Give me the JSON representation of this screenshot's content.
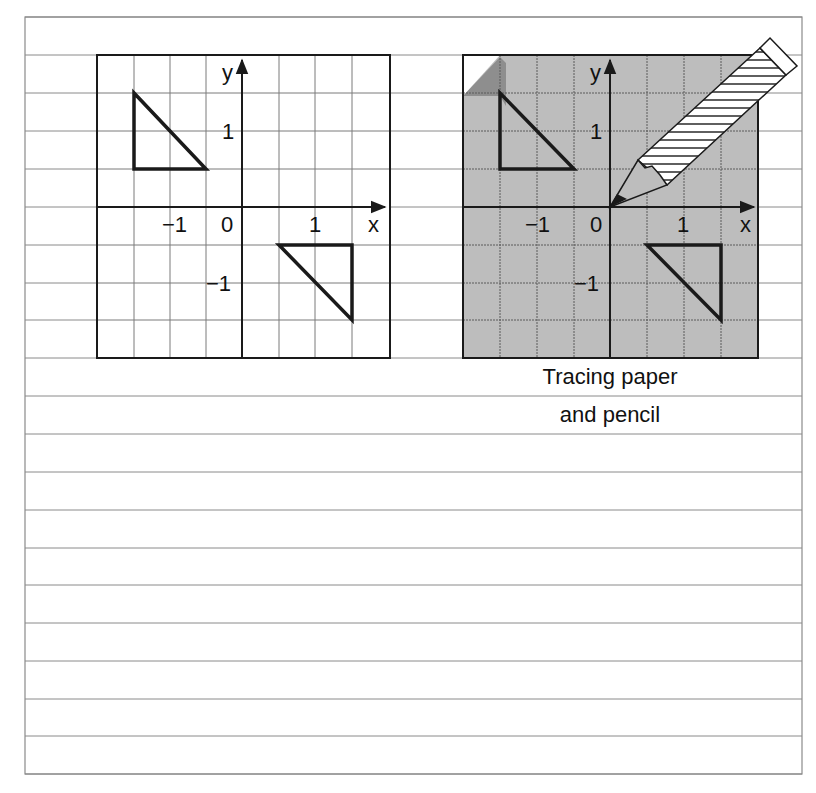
{
  "figure": {
    "colors": {
      "paper_shade": "#bdbdbd",
      "paper_fold": "#8e8e8e",
      "line": "#1a1a1a",
      "ruling": "#8a8a8a",
      "background": "#ffffff"
    },
    "caption": {
      "line1": "Tracing paper",
      "line2": "and pencil"
    },
    "rotation_label": "180°",
    "axis_labels": {
      "x": "x",
      "y": "y",
      "zero": "0",
      "one": "1",
      "minus_one": "−1"
    },
    "panels": [
      {
        "id": "original",
        "description": "Original object (triangle) and its image after rotation about origin",
        "shaded": false,
        "object_triangle": [
          [
            -1.5,
            1.5
          ],
          [
            -1.5,
            0.5
          ],
          [
            -0.5,
            0.5
          ]
        ],
        "image_triangle": [
          [
            0.5,
            -0.5
          ],
          [
            1.5,
            -0.5
          ],
          [
            1.5,
            -1.5
          ]
        ]
      },
      {
        "id": "tracing-start",
        "description": "Tracing paper placed over grid with pencil pinning origin",
        "shaded": true,
        "traced_triangle": [
          [
            -1.5,
            1.5
          ],
          [
            -1.5,
            0.5
          ],
          [
            -0.5,
            0.5
          ]
        ],
        "image_triangle": [
          [
            0.5,
            -0.5
          ],
          [
            1.5,
            -0.5
          ],
          [
            1.5,
            -1.5
          ]
        ],
        "pencil": true
      },
      {
        "id": "tracing-rotating",
        "description": "Tracing paper partly rotated about origin",
        "shaded": true,
        "pencil": true,
        "rotation_arrow": true
      },
      {
        "id": "tracing-rotated-180",
        "description": "Tracing paper rotated 180°; traced triangle now covers the image",
        "shaded": true,
        "traced_triangle_rotated": [
          [
            0.5,
            -0.5
          ],
          [
            1.5,
            -0.5
          ],
          [
            0.5,
            -1.5
          ]
        ],
        "traced_object": [
          [
            0.5,
            1.5
          ],
          [
            0.5,
            0.5
          ],
          [
            -0.5,
            0.5
          ]
        ]
      }
    ]
  }
}
